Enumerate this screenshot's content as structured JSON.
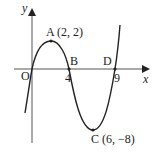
{
  "figure": {
    "type": "function-graph",
    "axes": {
      "x_label": "x",
      "y_label": "y",
      "origin_label": "O"
    },
    "points": [
      {
        "name": "A",
        "label": "A (2, 2)",
        "x": 2,
        "y": 2
      },
      {
        "name": "B",
        "label": "B",
        "x": 4,
        "y": 0
      },
      {
        "name": "C",
        "label": "C (6, −8)",
        "x": 6,
        "y": -8
      },
      {
        "name": "D",
        "label": "D",
        "x": 9,
        "y": 0
      }
    ],
    "x_ticks": [
      "4",
      "9"
    ],
    "colors": {
      "curve": "#222222",
      "axis": "#333333",
      "background": "#ffffff"
    }
  }
}
